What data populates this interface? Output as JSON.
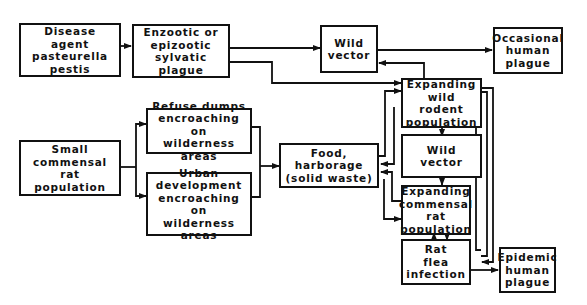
{
  "diagram": {
    "title": "",
    "nodes": {
      "disease_agent": "Disease agent\npasteurella\npestis",
      "sylvatic_plague": "Enzootic or\nepizootic\nsylvatic plague",
      "wild_vector_top": "Wild\nvector",
      "occasional_plague": "Occasional\nhuman\nplague",
      "small_rat_pop": "Small\ncommensal rat\npopulation",
      "refuse_dumps": "Refuse dumps\nencroaching on\nwilderness areas",
      "urban_dev": "Urban\ndevelopment\nencroaching on\nwilderness areas",
      "food_harborage": "Food, harborage\n(solid waste)",
      "expanding_wild_rodent": "Expanding\nwild\nrodent\npopulation",
      "wild_vector_mid": "Wild\nvector",
      "expanding_commensal_rat": "Expanding\ncommensal\nrat\npopulation",
      "rat_flea": "Rat\nflea\ninfection",
      "epidemic_plague": "Epidemic\nhuman\nplague"
    },
    "edges": [
      {
        "from": "Disease agent pasteurella pestis",
        "to": "Enzootic or epizootic sylvatic plague"
      },
      {
        "from": "Enzootic or epizootic sylvatic plague",
        "to": "Wild vector"
      },
      {
        "from": "Enzootic or epizootic sylvatic plague",
        "to": "Expanding wild rodent population"
      },
      {
        "from": "Wild vector",
        "to": "Occasional human plague"
      },
      {
        "from": "Expanding wild rodent population",
        "to": "Wild vector"
      },
      {
        "from": "Small commensal rat population",
        "to": "Refuse dumps encroaching on wilderness areas"
      },
      {
        "from": "Small commensal rat population",
        "to": "Urban development encroaching on wilderness areas"
      },
      {
        "from": "Refuse dumps encroaching on wilderness areas",
        "to": "Food, harborage (solid waste)"
      },
      {
        "from": "Urban development encroaching on wilderness areas",
        "to": "Food, harborage (solid waste)"
      },
      {
        "from": "Food, harborage (solid waste)",
        "to": "Expanding wild rodent population"
      },
      {
        "from": "Expanding wild rodent population",
        "to": "Food, harborage (solid waste)"
      },
      {
        "from": "Expanding commensal rat population",
        "to": "Food, harborage (solid waste)"
      },
      {
        "from": "Food, harborage (solid waste)",
        "to": "Expanding commensal rat population"
      },
      {
        "from": "Expanding wild rodent population",
        "to": "Wild vector (middle)"
      },
      {
        "from": "Wild vector (middle)",
        "to": "Expanding commensal rat population"
      },
      {
        "from": "Expanding commensal rat population",
        "to": "Rat flea infection"
      },
      {
        "from": "Rat flea infection",
        "to": "Expanding commensal rat population"
      },
      {
        "from": "Expanding wild rodent population",
        "to": "Rat flea infection"
      },
      {
        "from": "Rat flea infection",
        "to": "Expanding wild rodent population"
      },
      {
        "from": "Rat flea infection",
        "to": "Epidemic human plague"
      }
    ]
  }
}
